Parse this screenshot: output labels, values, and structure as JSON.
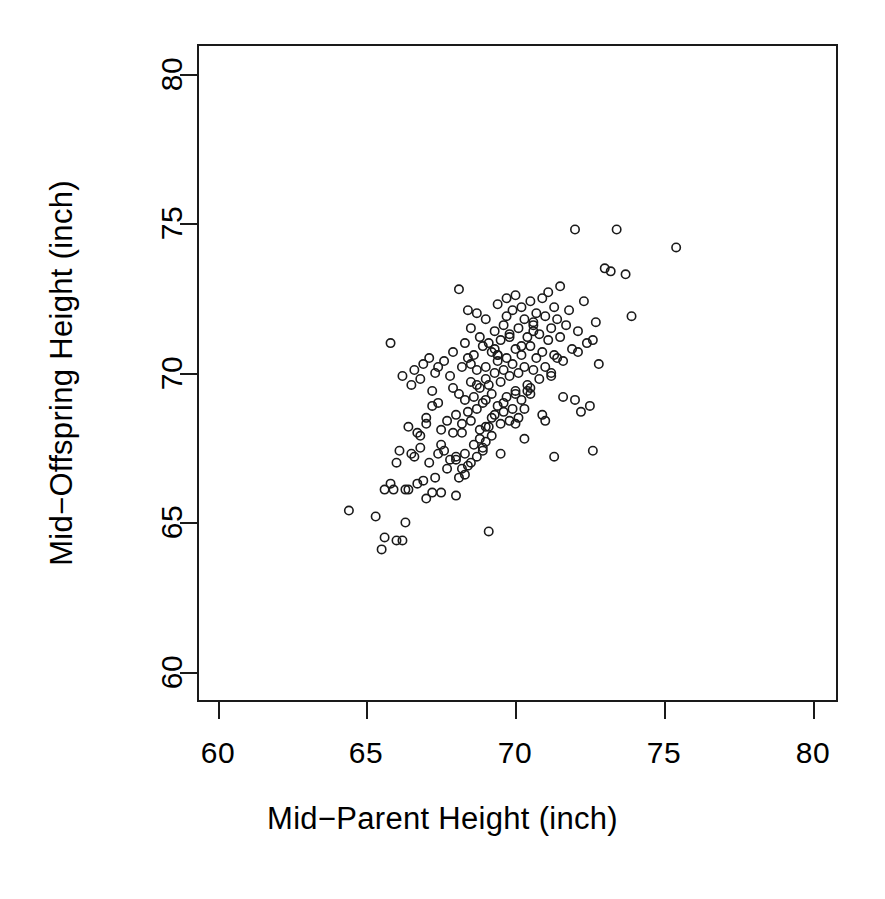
{
  "chart_data": {
    "type": "scatter",
    "title": "",
    "xlabel": "Mid−Parent Height (inch)",
    "ylabel": "Mid−Offspring Height (inch)",
    "xlim": [
      59.0,
      80.8
    ],
    "ylim": [
      59.6,
      80.6
    ],
    "xticks": [
      60,
      65,
      70,
      75,
      80
    ],
    "yticks": [
      60,
      65,
      70,
      75,
      80
    ],
    "xtick_labels": [
      "60",
      "65",
      "70",
      "75",
      "80"
    ],
    "ytick_labels": [
      "60",
      "65",
      "70",
      "75",
      "80"
    ],
    "grid": false,
    "legend": null,
    "marker": {
      "shape": "open-circle",
      "radius_px": 4.2,
      "stroke": "#1a1a1a",
      "stroke_width_px": 1.6,
      "fill": "none"
    },
    "axis_color": "#1a1a1a",
    "background": "#ffffff",
    "n_points": 205,
    "series": [
      {
        "name": "families",
        "x": [
          64.4,
          65.3,
          65.5,
          65.6,
          65.6,
          65.8,
          65.9,
          66.0,
          66.1,
          66.2,
          66.3,
          66.3,
          66.4,
          66.5,
          66.5,
          66.6,
          66.7,
          66.7,
          66.8,
          66.8,
          66.9,
          66.9,
          67.0,
          67.0,
          67.1,
          67.1,
          67.2,
          67.2,
          67.3,
          67.3,
          67.4,
          67.4,
          67.5,
          67.5,
          67.6,
          67.6,
          67.7,
          67.7,
          67.8,
          67.8,
          67.9,
          67.9,
          68.0,
          68.0,
          68.0,
          68.1,
          68.1,
          68.2,
          68.2,
          68.2,
          68.3,
          68.3,
          68.3,
          68.4,
          68.4,
          68.4,
          68.5,
          68.5,
          68.5,
          68.5,
          68.6,
          68.6,
          68.6,
          68.7,
          68.7,
          68.7,
          68.7,
          68.8,
          68.8,
          68.8,
          68.9,
          68.9,
          68.9,
          69.0,
          69.0,
          69.0,
          69.0,
          69.1,
          69.1,
          69.1,
          69.2,
          69.2,
          69.2,
          69.3,
          69.3,
          69.3,
          69.4,
          69.4,
          69.4,
          69.5,
          69.5,
          69.5,
          69.6,
          69.6,
          69.6,
          69.7,
          69.7,
          69.7,
          69.8,
          69.8,
          69.8,
          69.9,
          69.9,
          70.0,
          70.0,
          70.0,
          70.1,
          70.1,
          70.1,
          70.2,
          70.2,
          70.2,
          70.3,
          70.3,
          70.3,
          70.4,
          70.4,
          70.5,
          70.5,
          70.5,
          70.6,
          70.6,
          70.7,
          70.7,
          70.8,
          70.8,
          70.9,
          70.9,
          71.0,
          71.0,
          71.1,
          71.1,
          71.2,
          71.2,
          71.3,
          71.3,
          71.4,
          71.5,
          71.5,
          71.6,
          71.7,
          71.8,
          71.9,
          72.0,
          72.1,
          72.2,
          72.3,
          72.4,
          72.5,
          72.6,
          72.7,
          72.8,
          73.0,
          73.2,
          73.4,
          73.7,
          73.9,
          75.4,
          66.0,
          66.4,
          66.8,
          67.2,
          67.5,
          67.9,
          68.2,
          68.5,
          68.8,
          69.0,
          69.2,
          69.4,
          69.6,
          69.8,
          70.0,
          70.2,
          70.4,
          70.6,
          70.9,
          71.2,
          71.6,
          72.1,
          65.8,
          66.6,
          67.4,
          68.0,
          68.4,
          68.7,
          69.0,
          69.3,
          69.5,
          69.7,
          70.0,
          70.3,
          70.6,
          71.0,
          71.4,
          72.0,
          72.6,
          67.0,
          68.1,
          68.9,
          69.4,
          69.9,
          70.5,
          71.3,
          68.3,
          69.1,
          66.2
        ],
        "y": [
          65.4,
          65.2,
          64.1,
          66.1,
          64.5,
          71.0,
          66.1,
          64.4,
          67.4,
          64.4,
          66.1,
          65.0,
          66.1,
          69.6,
          67.3,
          70.1,
          68.0,
          66.3,
          69.8,
          67.5,
          70.3,
          66.4,
          68.3,
          65.8,
          70.5,
          67.0,
          69.4,
          66.0,
          70.0,
          66.5,
          69.0,
          67.3,
          68.1,
          66.0,
          70.4,
          67.4,
          68.4,
          66.8,
          69.9,
          67.1,
          70.7,
          68.0,
          68.6,
          67.2,
          65.9,
          69.3,
          66.5,
          70.2,
          68.3,
          66.8,
          71.0,
          69.1,
          67.3,
          70.5,
          68.7,
          66.9,
          71.5,
          69.7,
          68.4,
          67.0,
          70.6,
          69.2,
          67.6,
          72.0,
          70.1,
          68.8,
          67.2,
          71.2,
          69.5,
          68.1,
          70.9,
          69.0,
          67.5,
          71.8,
          70.2,
          69.1,
          67.7,
          71.0,
          69.6,
          68.2,
          70.7,
          69.3,
          67.9,
          71.4,
          70.0,
          68.6,
          72.3,
          70.4,
          68.9,
          71.1,
          69.7,
          68.3,
          71.6,
          70.1,
          68.7,
          71.9,
          70.5,
          69.2,
          71.3,
          69.9,
          68.4,
          72.1,
          70.3,
          72.6,
          70.8,
          69.4,
          71.5,
          70.0,
          68.5,
          72.2,
          70.6,
          69.1,
          71.8,
          70.2,
          68.8,
          71.2,
          69.6,
          72.4,
          70.9,
          69.3,
          71.6,
          70.1,
          72.0,
          70.5,
          71.3,
          69.8,
          72.5,
          70.7,
          71.9,
          70.2,
          72.7,
          71.1,
          71.5,
          69.9,
          72.2,
          70.6,
          71.8,
          72.9,
          71.2,
          70.4,
          71.6,
          72.1,
          70.8,
          74.8,
          71.4,
          68.7,
          72.4,
          71.0,
          68.9,
          67.4,
          71.7,
          70.3,
          73.5,
          73.4,
          74.8,
          73.3,
          71.9,
          74.2,
          67.0,
          68.2,
          67.9,
          68.9,
          67.6,
          69.5,
          68.0,
          70.3,
          67.8,
          69.8,
          68.5,
          70.6,
          69.0,
          71.2,
          68.3,
          70.9,
          69.4,
          71.7,
          68.6,
          70.0,
          69.2,
          70.7,
          66.3,
          67.2,
          70.2,
          67.1,
          72.1,
          69.6,
          68.2,
          70.8,
          67.3,
          72.5,
          69.3,
          67.8,
          71.4,
          68.4,
          70.5,
          69.1,
          71.1,
          68.5,
          72.8,
          67.4,
          70.6,
          68.8,
          69.5,
          67.2,
          66.6,
          64.7,
          69.9
        ]
      }
    ]
  }
}
